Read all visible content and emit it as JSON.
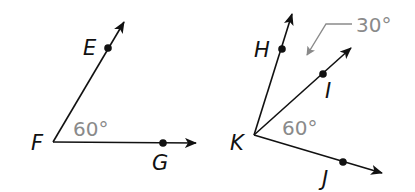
{
  "figures": [
    {
      "name": "angle-EFG",
      "vertex": {
        "label": "F",
        "x": 53,
        "y": 142
      },
      "rays": [
        {
          "to_point": "E",
          "point": {
            "x": 108,
            "y": 48
          },
          "tip": {
            "x": 124,
            "y": 22
          }
        },
        {
          "to_point": "G",
          "point": {
            "x": 163,
            "y": 143
          },
          "tip": {
            "x": 196,
            "y": 143
          }
        }
      ],
      "labels": {
        "vertex": "F",
        "p1": "E",
        "p2": "G"
      },
      "angle_label": "60°"
    },
    {
      "name": "angles-HKI-IKJ",
      "vertex": {
        "label": "K",
        "x": 254,
        "y": 135
      },
      "rays": [
        {
          "to_point": "H",
          "point": {
            "x": 282,
            "y": 49
          },
          "tip": {
            "x": 292,
            "y": 14
          }
        },
        {
          "to_point": "I",
          "point": {
            "x": 323,
            "y": 74
          },
          "tip": {
            "x": 351,
            "y": 48
          }
        },
        {
          "to_point": "J",
          "point": {
            "x": 343,
            "y": 162
          },
          "tip": {
            "x": 382,
            "y": 173
          }
        }
      ],
      "labels": {
        "vertex": "K",
        "p1": "H",
        "p2": "I",
        "p3": "J"
      },
      "angle_label_IKJ": "60°",
      "angle_label_HKI": "30°"
    }
  ],
  "colors": {
    "line": "#111111",
    "annotation": "#8a8a8a",
    "background": "#ffffff"
  }
}
